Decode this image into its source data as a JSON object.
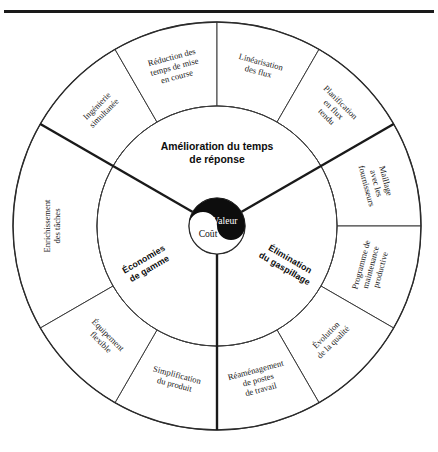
{
  "diagram": {
    "type": "concentric-wheel",
    "title_center_top": "Amélioration du temps de réponse",
    "geometry": {
      "cx": 217,
      "cy": 226,
      "r_outer": 204,
      "r_mid": 120,
      "r_hub": 28
    },
    "hub": {
      "value_label": "Valeur",
      "cost_label": "Coût",
      "style": "yin-yang",
      "value_fill": "#0d0d0d",
      "cost_fill": "#ffffff"
    },
    "inner_ring": {
      "sectors": [
        {
          "id": "amelioration-temps-reponse",
          "label": "Amélioration du temps de réponse",
          "label_line1": "Amélioration du temps",
          "label_line2": "de réponse",
          "start_angle": -150,
          "end_angle": -30,
          "orientation": "horizontal"
        },
        {
          "id": "economies-de-gamme",
          "label": "Économies de gamme",
          "label_line1": "Économies",
          "label_line2": "de gamme",
          "start_angle": 90,
          "end_angle": 210,
          "orientation": "radial"
        },
        {
          "id": "elimination-du-gaspillage",
          "label": "Élimination du gaspillage",
          "label_line1": "Élimination",
          "label_line2": "du gaspillage",
          "start_angle": -30,
          "end_angle": 90,
          "orientation": "radial"
        }
      ]
    },
    "outer_ring": {
      "sectors": [
        {
          "id": "enrichissement-des-taches",
          "lines": [
            "Enrichissement",
            "des tâches"
          ],
          "mid_angle": 180,
          "start_angle": 150,
          "end_angle": 210
        },
        {
          "id": "ingenierie-simultanee",
          "lines": [
            "Ingénierie",
            "simultanée"
          ],
          "mid_angle": 225,
          "start_angle": 210,
          "end_angle": 240
        },
        {
          "id": "reduction-temps-de-mise-en-course",
          "lines": [
            "Réduction des",
            "temps de mise",
            "en course"
          ],
          "mid_angle": 255,
          "start_angle": 240,
          "end_angle": 270
        },
        {
          "id": "linearisation-des-flux",
          "lines": [
            "Linéarisation",
            "des flux"
          ],
          "mid_angle": 285,
          "start_angle": 270,
          "end_angle": 300
        },
        {
          "id": "planification-en-flux-tendu",
          "lines": [
            "Planification",
            "en flux",
            "tendu"
          ],
          "mid_angle": 315,
          "start_angle": 300,
          "end_angle": 330
        },
        {
          "id": "maillage-avec-les-fournisseurs",
          "lines": [
            "Maillage",
            "avec les",
            "fournisseurs"
          ],
          "mid_angle": 345,
          "start_angle": 330,
          "end_angle": 360
        },
        {
          "id": "programme-de-maintenance-productive",
          "lines": [
            "Programme de",
            "maintenance",
            "productive"
          ],
          "mid_angle": 15,
          "start_angle": 0,
          "end_angle": 30
        },
        {
          "id": "evolution-de-la-qualite",
          "lines": [
            "Évolution",
            "de la qualité"
          ],
          "mid_angle": 45,
          "start_angle": 30,
          "end_angle": 60
        },
        {
          "id": "reamenagement-de-postes-de-travail",
          "lines": [
            "Réaménagement",
            "de postes",
            "de travail"
          ],
          "mid_angle": 75,
          "start_angle": 60,
          "end_angle": 90
        },
        {
          "id": "simplification-du-produit",
          "lines": [
            "Simplification",
            "du produit"
          ],
          "mid_angle": 105,
          "start_angle": 90,
          "end_angle": 120
        },
        {
          "id": "equipement-flexible",
          "lines": [
            "Équipement",
            "flexible"
          ],
          "mid_angle": 135,
          "start_angle": 120,
          "end_angle": 150
        }
      ]
    },
    "colors": {
      "line": "#2b2b2b",
      "ink": "#111111",
      "hub_black": "#0d0d0d",
      "page_bg": "#ffffff"
    }
  }
}
